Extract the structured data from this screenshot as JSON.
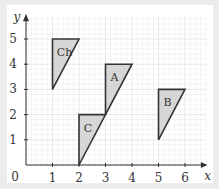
{
  "diagram": {
    "type": "coordinate-grid-shapes",
    "x_axis": {
      "label": "x",
      "ticks": [
        "1",
        "2",
        "3",
        "4",
        "5",
        "6"
      ],
      "origin_label": "0"
    },
    "y_axis": {
      "label": "y",
      "ticks": [
        "1",
        "2",
        "3",
        "4",
        "5"
      ]
    },
    "colors": {
      "fill": "#d6d6d6",
      "stroke": "#333333",
      "grid_minor": "#ececec",
      "grid_major": "#d9d9d9",
      "background": "#ececec"
    },
    "shapes": [
      {
        "label": "Ch",
        "vertices": [
          [
            1,
            5
          ],
          [
            2,
            5
          ],
          [
            1,
            3
          ]
        ]
      },
      {
        "label": "A",
        "vertices": [
          [
            3,
            4
          ],
          [
            4,
            4
          ],
          [
            3,
            2
          ]
        ]
      },
      {
        "label": "C",
        "vertices": [
          [
            2,
            2
          ],
          [
            3,
            2
          ],
          [
            2,
            0
          ]
        ]
      },
      {
        "label": "B",
        "vertices": [
          [
            5,
            3
          ],
          [
            6,
            3
          ],
          [
            5,
            1
          ]
        ]
      }
    ]
  }
}
